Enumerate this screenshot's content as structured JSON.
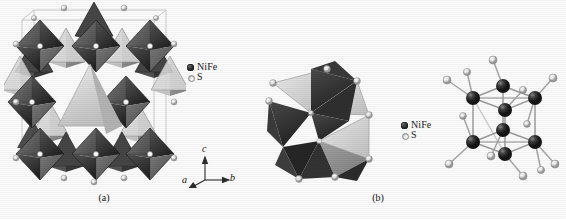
{
  "figure": {
    "background_color": "#fdfdfd",
    "style": "grayscale halftone scan of a crystal-structure figure"
  },
  "panels": [
    {
      "id": "a",
      "caption": "(a)",
      "description": "Polyhedral representation of the pentlandite-type unit cell: a 3x3 array of dark metal-sulfur octahedra interleaved with lighter tetrahedra",
      "legend": {
        "items": [
          {
            "marker": "metal-sphere-icon",
            "label": "NiFe",
            "color": "#2a2a2a"
          },
          {
            "marker": "sulfur-sphere-icon",
            "label": "S",
            "color": "#ededed"
          }
        ]
      },
      "axes": {
        "items": [
          {
            "name": "c",
            "direction": "up"
          },
          {
            "name": "b",
            "direction": "right"
          },
          {
            "name": "a",
            "direction": "lower-left"
          }
        ]
      }
    },
    {
      "id": "b",
      "caption": "(b)",
      "description": "Left: edge-sharing tetrahedral cluster drawn as light and dark polyhedra. Right: ball-and-stick cubane-like metal cluster of eight NiFe atoms with terminal S atoms",
      "legend": {
        "items": [
          {
            "marker": "metal-sphere-icon",
            "label": "NiFe",
            "color": "#2a2a2a"
          },
          {
            "marker": "sulfur-sphere-icon",
            "label": "S",
            "color": "#ededed"
          }
        ]
      }
    }
  ],
  "structure_data": {
    "type": "crystal-structure-diagram",
    "material": "NiFe sulfide (pentlandite-type)",
    "species": [
      {
        "symbol": "NiFe",
        "role": "metal",
        "render": "dark sphere",
        "color": "#2a2a2a"
      },
      {
        "symbol": "S",
        "role": "anion",
        "render": "light sphere",
        "color": "#ededed"
      }
    ],
    "panel_a": {
      "polyhedra_type": "octahedra + tetrahedra",
      "octahedra_grid": [
        3,
        3
      ],
      "octahedra_count": 9,
      "shading": {
        "dark_face": "#3b3b3b",
        "mid_face": "#6f6f6f",
        "light_face": "#d8d8d8"
      }
    },
    "panel_b_left": {
      "polyhedra_type": "edge-sharing tetrahedra",
      "polyhedra_count": 8,
      "shading": {
        "dark_face": "#3a3a3a",
        "light_face": "#cfcfcf"
      }
    },
    "panel_b_right": {
      "model": "ball-and-stick",
      "metal_atoms": 8,
      "cluster_geometry": "cube / cubane-like Ni4Fe4 core",
      "terminal_sulfur_atoms": 12,
      "bond_color": "#9a9a9a"
    }
  }
}
